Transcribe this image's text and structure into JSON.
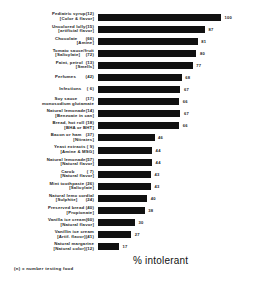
{
  "chart_data": {
    "type": "bar",
    "orientation": "horizontal",
    "title": "",
    "xlabel": "% intolerant",
    "ylabel": "",
    "xlim": [
      0,
      100
    ],
    "grid": false,
    "legend": null,
    "footnote": "(n) = number testing food",
    "bar_color": "#111111",
    "categories": [
      "Pediatric syrup(12) [Color & flavor]",
      "Uncolored lolly(15) [artificial flavor]",
      "Chocolate (66) [Amine]",
      "Tomato sauce/fruit [Salicylate] (72)",
      "Paint, petrol (13) [Smells]",
      "Perfumes (42)",
      "Infections ( 6)",
      "Soy sauce (17) monosodium glutamate",
      "Natural lemonade(14) [Benzoate in can]",
      "Bread, hot roll (18) [BHA or BHT]",
      "Bacon or ham (37) [Nitrates]",
      "Yeast extracts ( 9) [Amine & MSG]",
      "Natural lemonade(57) [Natural flavor]",
      "Carob ( 7) [Natural flavor]",
      "Mint toothpaste (26) [Salicylate]",
      "Natural lemo cordial [Sulphite] (24)",
      "Preserved bread (40) [Propionate]",
      "Vanilla ice cream(60) [Natural flavor]",
      "Vanillin ice cream [Artif. flavor](41)",
      "Natural margarine [Natural color](12)"
    ],
    "values": [
      100,
      87,
      81,
      80,
      77,
      68,
      67,
      66,
      67,
      66,
      46,
      44,
      44,
      43,
      43,
      40,
      38,
      30,
      27,
      17
    ],
    "value_labels": [
      "100",
      "87",
      "81",
      "80",
      "77",
      "68",
      "67",
      "66",
      "67",
      "66",
      "46",
      "44",
      "44",
      "43",
      "43",
      "40",
      "38",
      "30",
      "27",
      "17"
    ]
  },
  "rows": [
    {
      "line1": "Pediatric syrup(12)",
      "line2": "[Color & flavor]",
      "value": 100,
      "value_label": "100"
    },
    {
      "line1": "Uncolored lolly(15)",
      "line2": "[artificial flavor]",
      "value": 87,
      "value_label": "87"
    },
    {
      "line1": "Chocolate      (66)",
      "line2": "[Amine]",
      "value": 81,
      "value_label": "81"
    },
    {
      "line1": "Tomato sauce/fruit",
      "line2": "[Salicylate]    (72)",
      "value": 80,
      "value_label": "80"
    },
    {
      "line1": "Paint, petrol  (13)",
      "line2": "[Smells]",
      "value": 77,
      "value_label": "77"
    },
    {
      "line1": "Perfumes       (42)",
      "line2": "",
      "value": 68,
      "value_label": "68"
    },
    {
      "line1": "Infections    ( 6)",
      "line2": "",
      "value": 67,
      "value_label": "67"
    },
    {
      "line1": "Soy sauce      (17)",
      "line2": "monosodium glutamate",
      "value": 66,
      "value_label": "66"
    },
    {
      "line1": "Natural lemonade(14)",
      "line2": "[Benzoate in can]",
      "value": 67,
      "value_label": "67"
    },
    {
      "line1": "Bread, hot roll (18)",
      "line2": "[BHA or BHT]",
      "value": 66,
      "value_label": "66"
    },
    {
      "line1": "Bacon or ham   (37)",
      "line2": "[Nitrates]",
      "value": 46,
      "value_label": "46"
    },
    {
      "line1": "Yeast extracts ( 9)",
      "line2": "[Amine & MSG]",
      "value": 44,
      "value_label": "44"
    },
    {
      "line1": "Natural lemonade(57)",
      "line2": "[Natural flavor]",
      "value": 44,
      "value_label": "44"
    },
    {
      "line1": "Carob         ( 7)",
      "line2": "[Natural flavor]",
      "value": 43,
      "value_label": "43"
    },
    {
      "line1": "Mint toothpaste (26)",
      "line2": "[Salicylate]",
      "value": 43,
      "value_label": "43"
    },
    {
      "line1": "Natural lemo cordial",
      "line2": "[Sulphite]      (24)",
      "value": 40,
      "value_label": "40"
    },
    {
      "line1": "Preserved bread (40)",
      "line2": "[Propionate]",
      "value": 38,
      "value_label": "38"
    },
    {
      "line1": "Vanilla ice cream(60)",
      "line2": "[Natural flavor]",
      "value": 30,
      "value_label": "30"
    },
    {
      "line1": "Vanillin ice cream",
      "line2": "[Artif. flavor](41)",
      "value": 27,
      "value_label": "27"
    },
    {
      "line1": "Natural margarine",
      "line2": "[Natural color](12)",
      "value": 17,
      "value_label": "17"
    }
  ],
  "axis": {
    "title": "% intolerant"
  },
  "footnote": {
    "text": "(n) = number testing food"
  }
}
